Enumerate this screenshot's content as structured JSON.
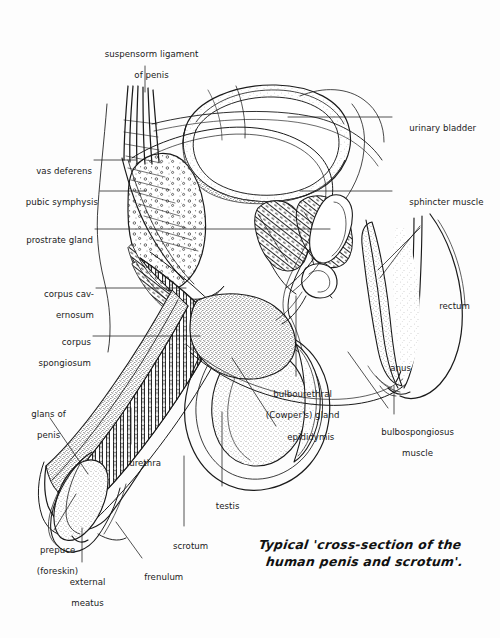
{
  "figure": {
    "title_caption_line1": "Typical 'cross-section of the",
    "title_caption_line2": "human penis and scrotum'.",
    "background_color": "#fdfdfd",
    "ink_color": "#1a1a1a",
    "width": 500,
    "height": 638,
    "style": "pen-and-ink stipple line drawing, medical illustration, sagittal section"
  },
  "labels": {
    "suspensory_ligament": {
      "line1": "suspensorm ligament",
      "line2": "of penis"
    },
    "vas_deferens": {
      "line1": "vas deferens"
    },
    "pubic_symphysis": {
      "line1": "pubic symphysis"
    },
    "prostrate_gland": {
      "line1": "prostrate gland"
    },
    "corpus_cavernosum": {
      "line1": "corpus cav-",
      "line2": "ernosum"
    },
    "corpus_spongiosum": {
      "line1": "corpus",
      "line2": "spongiosum"
    },
    "glans_of_penis": {
      "line1": "glans of",
      "line2": "penis"
    },
    "urethra": {
      "line1": "urethra"
    },
    "prepuce": {
      "line1": "prepuce",
      "line2": "(foreskin)"
    },
    "external_meatus": {
      "line1": "external",
      "line2": "meatus"
    },
    "frenulum": {
      "line1": "frenulum"
    },
    "scrotum": {
      "line1": "scrotum"
    },
    "testis": {
      "line1": "testis"
    },
    "epididymis": {
      "line1": "epididymis"
    },
    "bulbourethral_gland": {
      "line1": "bulbourethral",
      "line2": "(Cowper's) gland"
    },
    "urinary_bladder": {
      "line1": "urinary bladder"
    },
    "sphincter_muscle": {
      "line1": "sphincter muscle"
    },
    "rectum": {
      "line1": "rectum"
    },
    "anus": {
      "line1": "anus"
    },
    "bulbospongiosus_muscle": {
      "line1": "bulbospongiosus",
      "line2": "muscle"
    }
  }
}
